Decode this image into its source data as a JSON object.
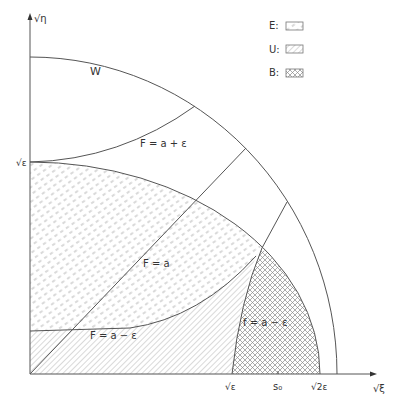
{
  "axes": {
    "y_label": "√η",
    "x_label": "√ξ",
    "y_ticks": [
      {
        "label": "√ε",
        "y": 162
      }
    ],
    "x_ticks": [
      {
        "label": "√ε",
        "x": 232
      },
      {
        "label": "s₀",
        "x": 278
      },
      {
        "label": "√2ε",
        "x": 320
      }
    ]
  },
  "curves": {
    "W": "W",
    "F_plus": "F = a + ε",
    "F": "F = a",
    "F_minus": "F = a − ε",
    "f_minus": "f = a − ε"
  },
  "legend": [
    {
      "key": "E",
      "label": "E:",
      "pattern": "dash-hatch"
    },
    {
      "key": "U",
      "label": "U:",
      "pattern": "diagonal-hatch"
    },
    {
      "key": "B",
      "label": "B:",
      "pattern": "cross-hatch"
    }
  ],
  "colors": {
    "line": "#555555",
    "hatch": "#9a9a9a",
    "text": "#333333",
    "background": "#ffffff"
  }
}
